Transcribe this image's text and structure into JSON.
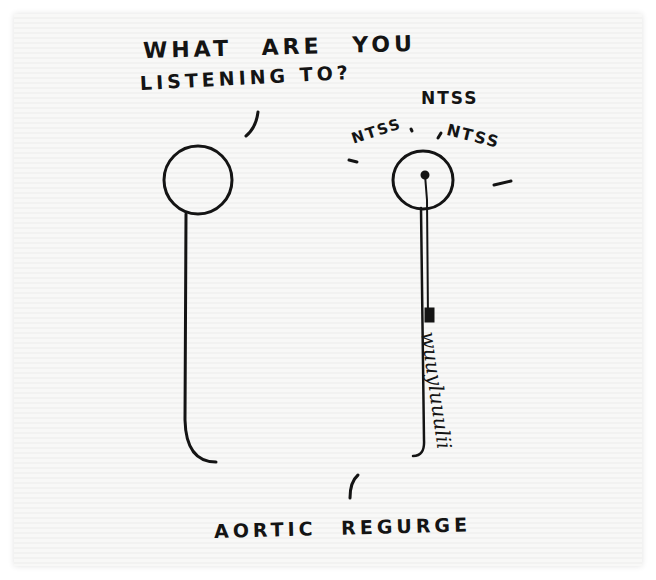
{
  "cartoon": {
    "speech_line1": "WHAT ARE YOU",
    "speech_line2": "LISTENING TO?",
    "sound_top": "NTSS",
    "sound_left": "NTSS",
    "sound_right": "NTSS",
    "murmur_squiggle": "wuuyluuulii",
    "caption": "AORTIC REGURGE"
  },
  "colors": {
    "ink": "#141414",
    "paper": "#f7f7f6"
  }
}
